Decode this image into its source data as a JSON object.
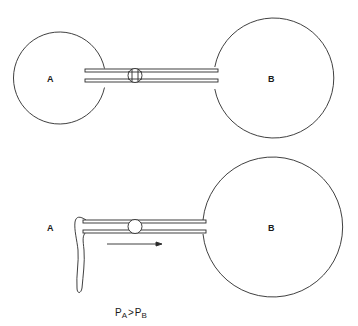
{
  "diagram": {
    "top_panel": {
      "bubble_a": {
        "label": "A",
        "cx": 62,
        "cy": 78,
        "r": 46
      },
      "bubble_b": {
        "label": "B",
        "cx": 273,
        "cy": 78,
        "r": 60
      },
      "tube": {
        "x1": 85,
        "x2": 218,
        "top_y": 70.5,
        "bottom_y": 80.5,
        "wall": 3
      },
      "stopcock": {
        "state": "closed",
        "cx": 135,
        "cy": 75.5,
        "r": 7
      }
    },
    "bottom_panel": {
      "bubble_a": {
        "label": "A",
        "state": "collapsed"
      },
      "bubble_b": {
        "label": "B",
        "cx": 272,
        "cy": 227,
        "r": 70
      },
      "tube": {
        "x1": 83,
        "x2": 206,
        "top_y": 221.5,
        "bottom_y": 231.5,
        "wall": 3
      },
      "stopcock": {
        "state": "open",
        "cx": 135,
        "cy": 226.5,
        "r": 7
      },
      "flow_arrow": {
        "direction": "A to B",
        "x1": 107,
        "x2": 162,
        "y": 244
      },
      "equation": {
        "p": "P",
        "sub_a": "A",
        "op": ">",
        "sub_b": "B"
      }
    },
    "colors": {
      "line": "#2a2a2a",
      "background": "#ffffff"
    }
  }
}
